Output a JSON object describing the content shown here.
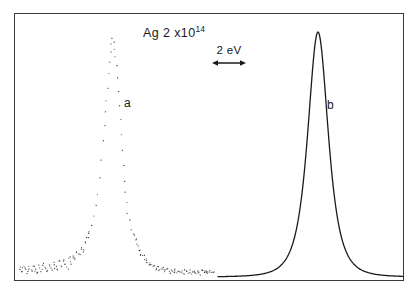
{
  "figure": {
    "title_prefix": "Ag 2 x10",
    "title_exponent": "14",
    "title_full": "Ag 2 x10¹⁴",
    "scale_bar_label": "2 eV",
    "curve_a_label": "a",
    "curve_b_label": "b",
    "frame_color": "#3a3a3a",
    "curve_color": "#1a1a1a",
    "background_color": "#ffffff"
  },
  "chart_data": {
    "type": "line",
    "xlabel": "",
    "ylabel": "",
    "grid": false,
    "legend": "inline-labels",
    "annotations": [
      {
        "name": "scale-bar",
        "label": "2 eV",
        "x_start": 212,
        "x_end": 238,
        "y": 68
      },
      {
        "name": "curve-a-label",
        "label": "a",
        "x": 128,
        "y": 103
      },
      {
        "name": "curve-b-label",
        "label": "b",
        "x": 331,
        "y": 105
      },
      {
        "name": "title",
        "label": "Ag 2 x10¹⁴",
        "x": 143,
        "y": 30
      }
    ],
    "axis_ranges": {
      "x": [
        14,
        404
      ],
      "y": [
        13,
        281
      ]
    },
    "series": [
      {
        "name": "a",
        "style": "scatter-noisy",
        "description": "Noisy scattered-point photoemission peak, left half of frame",
        "peak_x": 112,
        "peak_y": 38,
        "baseline_y": 272,
        "half_width": 16,
        "x_range": [
          18,
          214
        ],
        "points": [
          [
            19,
            268
          ],
          [
            21,
            271
          ],
          [
            23,
            266
          ],
          [
            25,
            269
          ],
          [
            27,
            272
          ],
          [
            29,
            267
          ],
          [
            31,
            270
          ],
          [
            33,
            265
          ],
          [
            35,
            269
          ],
          [
            37,
            272
          ],
          [
            39,
            266
          ],
          [
            41,
            270
          ],
          [
            43,
            264
          ],
          [
            45,
            268
          ],
          [
            47,
            271
          ],
          [
            49,
            265
          ],
          [
            51,
            269
          ],
          [
            53,
            263
          ],
          [
            55,
            267
          ],
          [
            57,
            270
          ],
          [
            59,
            262
          ],
          [
            61,
            266
          ],
          [
            63,
            260
          ],
          [
            65,
            264
          ],
          [
            67,
            268
          ],
          [
            69,
            258
          ],
          [
            71,
            262
          ],
          [
            73,
            256
          ],
          [
            75,
            259
          ],
          [
            77,
            252
          ],
          [
            79,
            255
          ],
          [
            81,
            248
          ],
          [
            83,
            250
          ],
          [
            85,
            243
          ],
          [
            87,
            238
          ],
          [
            89,
            232
          ],
          [
            91,
            225
          ],
          [
            93,
            216
          ],
          [
            95,
            205
          ],
          [
            97,
            193
          ],
          [
            99,
            178
          ],
          [
            101,
            160
          ],
          [
            103,
            140
          ],
          [
            104,
            124
          ],
          [
            105,
            112
          ],
          [
            106,
            100
          ],
          [
            107,
            88
          ],
          [
            108,
            74
          ],
          [
            109,
            62
          ],
          [
            110,
            52
          ],
          [
            111,
            44
          ],
          [
            112,
            38
          ],
          [
            113,
            41
          ],
          [
            114,
            48
          ],
          [
            115,
            56
          ],
          [
            116,
            66
          ],
          [
            117,
            78
          ],
          [
            118,
            90
          ],
          [
            119,
            104
          ],
          [
            120,
            118
          ],
          [
            121,
            134
          ],
          [
            122,
            150
          ],
          [
            123,
            166
          ],
          [
            124,
            180
          ],
          [
            125,
            192
          ],
          [
            126,
            202
          ],
          [
            127,
            212
          ],
          [
            129,
            220
          ],
          [
            131,
            228
          ],
          [
            133,
            234
          ],
          [
            135,
            240
          ],
          [
            137,
            245
          ],
          [
            139,
            249
          ],
          [
            141,
            253
          ],
          [
            143,
            256
          ],
          [
            145,
            259
          ],
          [
            147,
            261
          ],
          [
            149,
            263
          ],
          [
            151,
            265
          ],
          [
            153,
            266
          ],
          [
            155,
            268
          ],
          [
            157,
            267
          ],
          [
            159,
            269
          ],
          [
            161,
            270
          ],
          [
            163,
            268
          ],
          [
            165,
            271
          ],
          [
            167,
            269
          ],
          [
            169,
            272
          ],
          [
            171,
            270
          ],
          [
            173,
            271
          ],
          [
            175,
            269
          ],
          [
            177,
            272
          ],
          [
            179,
            270
          ],
          [
            181,
            271
          ],
          [
            183,
            273
          ],
          [
            185,
            270
          ],
          [
            187,
            272
          ],
          [
            189,
            271
          ],
          [
            191,
            273
          ],
          [
            193,
            270
          ],
          [
            195,
            272
          ],
          [
            197,
            271
          ],
          [
            199,
            273
          ],
          [
            201,
            271
          ],
          [
            203,
            272
          ],
          [
            205,
            270
          ],
          [
            207,
            272
          ],
          [
            209,
            271
          ],
          [
            211,
            273
          ],
          [
            213,
            271
          ]
        ]
      },
      {
        "name": "b",
        "style": "smooth-line",
        "description": "Smooth Lorentzian-like peak, right half of frame",
        "peak_x": 318,
        "peak_y": 32,
        "baseline_y": 277,
        "half_width": 13,
        "x_range": [
          218,
          403
        ]
      }
    ]
  }
}
